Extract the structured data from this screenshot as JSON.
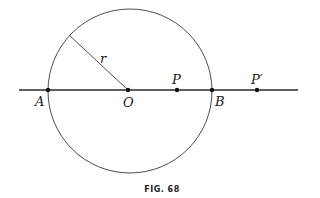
{
  "figure": {
    "caption": "FIG. 68",
    "circle": {
      "cx": 130,
      "cy": 91,
      "r": 82
    },
    "line": {
      "x1": 19,
      "x2": 298,
      "y": 90
    },
    "radius": {
      "label": "r",
      "from": [
        69,
        35
      ],
      "to": [
        128,
        90
      ]
    },
    "points": [
      {
        "id": "A",
        "label": "A",
        "x": 48,
        "y": 90
      },
      {
        "id": "O",
        "label": "O",
        "x": 128,
        "y": 90
      },
      {
        "id": "P",
        "label": "P",
        "x": 177,
        "y": 90
      },
      {
        "id": "B",
        "label": "B",
        "x": 212,
        "y": 90
      },
      {
        "id": "P-prime",
        "label": "P′",
        "x": 257,
        "y": 90
      }
    ],
    "colors": {
      "stroke": "#2a2a2a",
      "background": "#ffffff"
    }
  }
}
